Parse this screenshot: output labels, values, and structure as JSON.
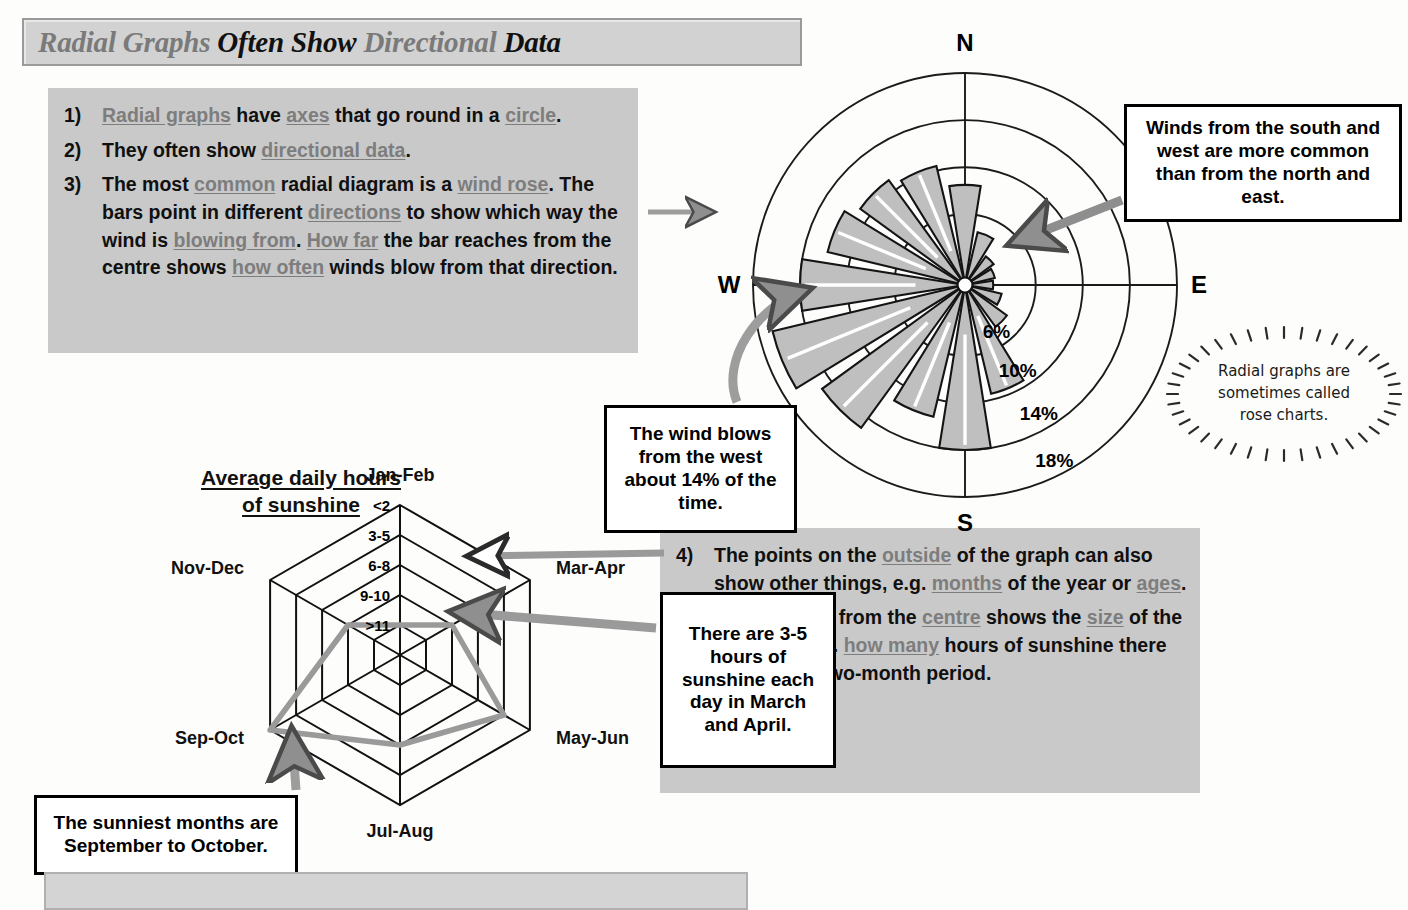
{
  "title": {
    "words": [
      {
        "text": "Radial Graphs",
        "tone": "gray"
      },
      {
        "text": "Often Show",
        "tone": "black"
      },
      {
        "text": "Directional",
        "tone": "gray"
      },
      {
        "text": "Data",
        "tone": "black"
      }
    ],
    "full": "Radial Graphs Often Show Directional Data"
  },
  "notes_left": [
    {
      "num": "1)",
      "parts": [
        {
          "t": "Radial graphs",
          "kw": true
        },
        {
          "t": " have ",
          "kw": false
        },
        {
          "t": "axes",
          "kw": true
        },
        {
          "t": " that go round in a ",
          "kw": false
        },
        {
          "t": "circle",
          "kw": true
        },
        {
          "t": ".",
          "kw": false
        }
      ]
    },
    {
      "num": "2)",
      "parts": [
        {
          "t": "They often show ",
          "kw": false
        },
        {
          "t": "directional data",
          "kw": true
        },
        {
          "t": ".",
          "kw": false
        }
      ]
    },
    {
      "num": "3)",
      "parts": [
        {
          "t": "The most ",
          "kw": false
        },
        {
          "t": "common",
          "kw": true
        },
        {
          "t": " radial diagram is a ",
          "kw": false
        },
        {
          "t": "wind rose",
          "kw": true
        },
        {
          "t": ". The bars point in different ",
          "kw": false
        },
        {
          "t": "directions",
          "kw": true
        },
        {
          "t": " to show which way the wind is ",
          "kw": false
        },
        {
          "t": "blowing from",
          "kw": true
        },
        {
          "t": ". ",
          "kw": false
        },
        {
          "t": "How far",
          "kw": true
        },
        {
          "t": " the bar reaches from the centre shows ",
          "kw": false
        },
        {
          "t": "how often",
          "kw": true
        },
        {
          "t": " winds blow from that direction.",
          "kw": false
        }
      ]
    }
  ],
  "notes_right": [
    {
      "num": "4)",
      "parts": [
        {
          "t": "The points on the ",
          "kw": false
        },
        {
          "t": "outside",
          "kw": true
        },
        {
          "t": " of the graph can also show other things, e.g. ",
          "kw": false
        },
        {
          "t": "months",
          "kw": true
        },
        {
          "t": " of the year or ",
          "kw": false
        },
        {
          "t": "ages",
          "kw": true
        },
        {
          "t": ".",
          "kw": false
        }
      ]
    },
    {
      "num": "5)",
      "parts": [
        {
          "t": "The ",
          "kw": false
        },
        {
          "t": "distance",
          "kw": true
        },
        {
          "t": " from the ",
          "kw": false
        },
        {
          "t": "centre",
          "kw": true
        },
        {
          "t": " shows the ",
          "kw": false
        },
        {
          "t": "size",
          "kw": true
        },
        {
          "t": " of the category, e.g. ",
          "kw": false
        },
        {
          "t": "how many",
          "kw": true
        },
        {
          "t": " hours of sunshine there are in each two-month period.",
          "kw": false
        }
      ]
    }
  ],
  "callouts": {
    "winds": "Winds from the south and west are more common than from the north and east.",
    "west_wind": "The wind blows from the west about 14% of the time.",
    "sun_hours": "There are 3-5 hours of sunshine each day in March and April.",
    "sunniest": "The sunniest months are September to October."
  },
  "rose_note": [
    "Radial graphs are",
    "sometimes called",
    "rose charts."
  ],
  "radar_heading": [
    "Average daily hours",
    "of sunshine"
  ],
  "chart_data": [
    {
      "type": "bar",
      "subtype": "wind-rose",
      "title": "Wind rose",
      "xlabel": "Direction wind blows from",
      "ylabel": "Frequency (%)",
      "ylim": [
        0,
        18
      ],
      "grid": true,
      "ring_labels": [
        "6%",
        "10%",
        "14%",
        "18%"
      ],
      "ring_values": [
        6,
        10,
        14,
        18
      ],
      "compass_labels": [
        "N",
        "E",
        "S",
        "W"
      ],
      "categories": [
        "N",
        "NNE",
        "NE",
        "ENE",
        "E",
        "ESE",
        "SE",
        "SSE",
        "S",
        "SSW",
        "SW",
        "WSW",
        "W",
        "WNW",
        "NW",
        "NNW"
      ],
      "values": [
        8.5,
        4.6,
        3.0,
        2.6,
        2.4,
        3.2,
        4.4,
        9.5,
        14.0,
        11.5,
        15.0,
        16.8,
        14.0,
        12.0,
        11.0,
        10.4
      ]
    },
    {
      "type": "line",
      "subtype": "radar",
      "title": "Average daily hours of sunshine",
      "xlabel": "",
      "ylabel": "Hours of sunshine",
      "grid": true,
      "categories": [
        "Jan-Feb",
        "Mar-Apr",
        "May-Jun",
        "Jul-Aug",
        "Sep-Oct",
        "Nov-Dec"
      ],
      "tick_labels": [
        "<2",
        "3-5",
        "6-8",
        "9-10",
        ">11"
      ],
      "tick_levels": [
        1,
        2,
        3,
        4,
        5
      ],
      "values": [
        1,
        2,
        4,
        3,
        5,
        2
      ]
    }
  ]
}
